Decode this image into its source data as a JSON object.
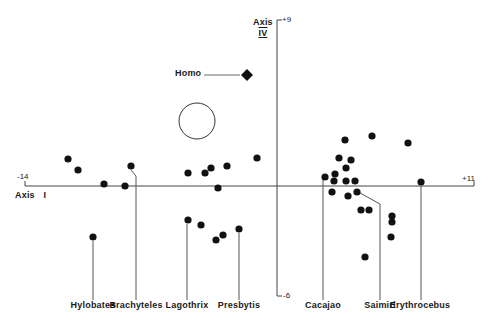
{
  "chart_data": {
    "type": "scatter",
    "title": "",
    "xlabel": "Axis I",
    "ylabel": "Axis IV",
    "xlim": [
      -14,
      11
    ],
    "ylim": [
      -6,
      9
    ],
    "x_tick_labels": {
      "min": "-14",
      "max": "+11"
    },
    "y_tick_labels": {
      "max": "+9",
      "min": "-6"
    },
    "grid": false,
    "legend": null,
    "annotations": [
      {
        "label": "Homo",
        "marker": "diamond",
        "x": -1.5,
        "y": 5.8
      },
      {
        "label": "open-circle",
        "marker": "circle-open",
        "x": -4.0,
        "y": 3.3
      }
    ],
    "genus_labels": [
      "Hylobates",
      "Brachyteles",
      "Lagothrix",
      "Presbytis",
      "Cacajao",
      "Saimiri",
      "Erythrocebus"
    ],
    "series": [
      {
        "name": "Hylobates",
        "points": [
          [
            -11.6,
            1.4
          ],
          [
            -11.1,
            0.8
          ],
          [
            -9.6,
            0.1
          ],
          [
            -10.8,
            -2.8
          ]
        ]
      },
      {
        "name": "Brachyteles",
        "points": [
          [
            -8.3,
            1.0
          ],
          [
            -8.5,
            -0.1
          ]
        ]
      },
      {
        "name": "Lagothrix",
        "points": [
          [
            -4.9,
            0.7
          ],
          [
            -4.9,
            -1.8
          ],
          [
            -4.2,
            -2.1
          ]
        ]
      },
      {
        "name": "Presbytis",
        "points": [
          [
            -4.0,
            0.7
          ],
          [
            -3.7,
            0.9
          ],
          [
            -2.8,
            1.0
          ],
          [
            -1.3,
            1.4
          ],
          [
            -3.4,
            -0.1
          ],
          [
            -3.4,
            -2.8
          ],
          [
            -3.0,
            -2.5
          ],
          [
            -2.2,
            -2.2
          ]
        ]
      },
      {
        "name": "Cacajao",
        "points": [
          [
            2.5,
            2.4
          ],
          [
            3.1,
            1.4
          ],
          [
            3.7,
            1.3
          ],
          [
            3.2,
            0.9
          ],
          [
            2.6,
            0.6
          ],
          [
            2.1,
            0.5
          ],
          [
            2.6,
            0.3
          ],
          [
            3.2,
            0.3
          ],
          [
            3.7,
            0.3
          ],
          [
            2.4,
            -0.3
          ]
        ]
      },
      {
        "name": "Saimiri",
        "points": [
          [
            3.1,
            -0.5
          ],
          [
            3.6,
            -0.3
          ],
          [
            4.0,
            -1.2
          ],
          [
            4.4,
            -1.2
          ],
          [
            3.9,
            -3.6
          ]
        ]
      },
      {
        "name": "Other-platyrrhines",
        "points": [
          [
            4.0,
            2.6
          ],
          [
            6.1,
            2.3
          ],
          [
            6.0,
            -1.5
          ],
          [
            6.0,
            -1.8
          ],
          [
            6.0,
            -2.6
          ]
        ]
      },
      {
        "name": "Erythrocebus",
        "points": [
          [
            7.8,
            0.2
          ]
        ]
      }
    ]
  },
  "axes": {
    "x": {
      "name": "Axis",
      "numeral": "I",
      "min_label": "-14",
      "max_label": "+11"
    },
    "y": {
      "name": "Axis",
      "numeral": "IV",
      "max_label": "+9",
      "min_label": "-6"
    }
  },
  "labels": {
    "homo": "Homo",
    "genera": [
      {
        "name": "Hylobates",
        "x": 93
      },
      {
        "name": "Brachyteles",
        "x": 136
      },
      {
        "name": "Lagothrix",
        "x": 187
      },
      {
        "name": "Presbytis",
        "x": 239
      },
      {
        "name": "Cacajao",
        "x": 323
      },
      {
        "name": "Saimiri",
        "x": 380
      },
      {
        "name": "Erythrocebus",
        "x": 420
      }
    ]
  },
  "pixel_points": [
    [
      68,
      159
    ],
    [
      78,
      170
    ],
    [
      104,
      184
    ],
    [
      125,
      186
    ],
    [
      131,
      166
    ],
    [
      93,
      237
    ],
    [
      188,
      173
    ],
    [
      205,
      173
    ],
    [
      211,
      168
    ],
    [
      227,
      166
    ],
    [
      257,
      158
    ],
    [
      218,
      188
    ],
    [
      188,
      220
    ],
    [
      201,
      225
    ],
    [
      216,
      240
    ],
    [
      223,
      235
    ],
    [
      239,
      229
    ],
    [
      345,
      140
    ],
    [
      372,
      136
    ],
    [
      408,
      143
    ],
    [
      339,
      158
    ],
    [
      351,
      160
    ],
    [
      346,
      168
    ],
    [
      335,
      174
    ],
    [
      325,
      177
    ],
    [
      334,
      181
    ],
    [
      346,
      181
    ],
    [
      355,
      181
    ],
    [
      332,
      192
    ],
    [
      348,
      196
    ],
    [
      357,
      192
    ],
    [
      361,
      210
    ],
    [
      369,
      210
    ],
    [
      392,
      216
    ],
    [
      392,
      222
    ],
    [
      391,
      237
    ],
    [
      365,
      257
    ],
    [
      421,
      182
    ]
  ],
  "leaders": [
    {
      "genus": "Hylobates",
      "path": "M93,241 L93,300"
    },
    {
      "genus": "Brachyteles",
      "path": "M131,170 L136,176 L136,300"
    },
    {
      "genus": "Lagothrix",
      "path": "M187,224 L187,300"
    },
    {
      "genus": "Presbytis",
      "path": "M239,233 L239,300"
    },
    {
      "genus": "Cacajao",
      "path": "M323,180 L323,300"
    },
    {
      "genus": "Saimiri",
      "path": "M360,193 L380,204 L380,300"
    },
    {
      "genus": "Erythrocebus",
      "path": "M421,186 L421,300"
    }
  ],
  "caption": ""
}
